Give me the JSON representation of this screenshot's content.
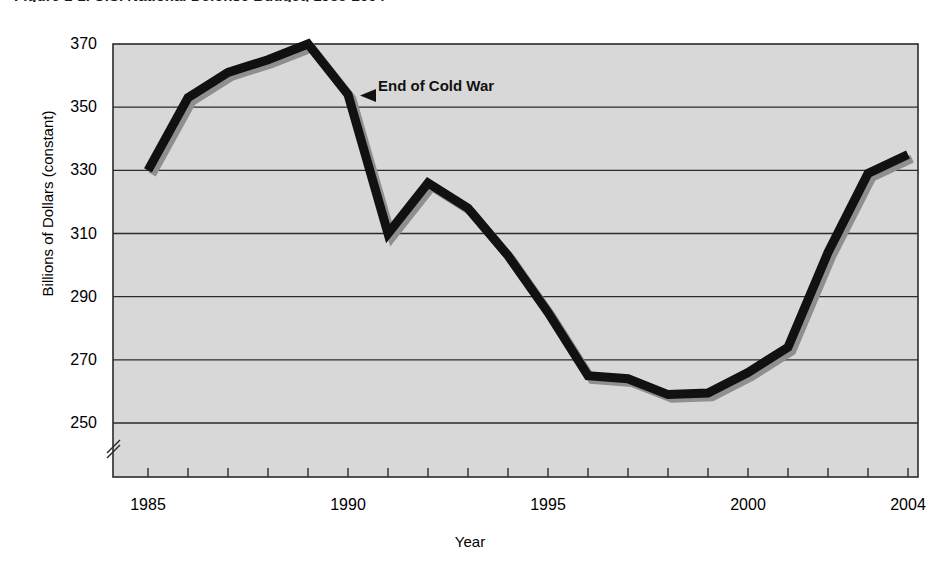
{
  "figure": {
    "title": "Figure 1-1.  U.S. National Defense Budget, 1985-2004",
    "annotation": "End of Cold War"
  },
  "axes": {
    "ylabel": "Billions of Dollars (constant)",
    "xlabel": "Year",
    "yticks": [
      "250",
      "270",
      "290",
      "310",
      "330",
      "350",
      "370"
    ],
    "xticks": [
      "1985",
      "1990",
      "1995",
      "2000",
      "2004"
    ],
    "axis_break_marker": "//"
  },
  "colors": {
    "plot_background": "#d8d8d8",
    "line": "#111111",
    "shadow": "#8f8f8f",
    "gridline": "#2b2b2b",
    "border": "#2b2b2b",
    "text": "#111111"
  },
  "chart_data": {
    "type": "line",
    "title": "Figure 1-1.  U.S. National Defense Budget, 1985-2004",
    "xlabel": "Year",
    "ylabel": "Billions of Dollars (constant)",
    "xlim": [
      1984,
      2005
    ],
    "ylim": [
      240,
      370
    ],
    "ytick_values": [
      250,
      270,
      290,
      310,
      330,
      350,
      370
    ],
    "xtick_values": [
      1985,
      1990,
      1995,
      2000,
      2004
    ],
    "grid": true,
    "grid_axis": "y",
    "legend": null,
    "y_axis_broken": true,
    "annotations": [
      {
        "text": "End of Cold War",
        "points_to_year": 1990,
        "points_to_value": 354,
        "arrow": "left"
      }
    ],
    "x": [
      1985,
      1986,
      1987,
      1988,
      1989,
      1990,
      1991,
      1992,
      1993,
      1994,
      1995,
      1996,
      1997,
      1998,
      1999,
      2000,
      2001,
      2002,
      2003,
      2004
    ],
    "values": [
      330,
      353,
      361,
      365,
      370,
      354,
      310,
      326,
      318,
      303,
      285,
      265,
      264,
      259,
      259.5,
      266,
      274,
      304,
      329,
      335
    ],
    "series": [
      {
        "name": "National Defense Budget",
        "values": [
          330,
          353,
          361,
          365,
          370,
          354,
          310,
          326,
          318,
          303,
          285,
          265,
          264,
          259,
          259.5,
          266,
          274,
          304,
          329,
          335
        ]
      }
    ]
  }
}
